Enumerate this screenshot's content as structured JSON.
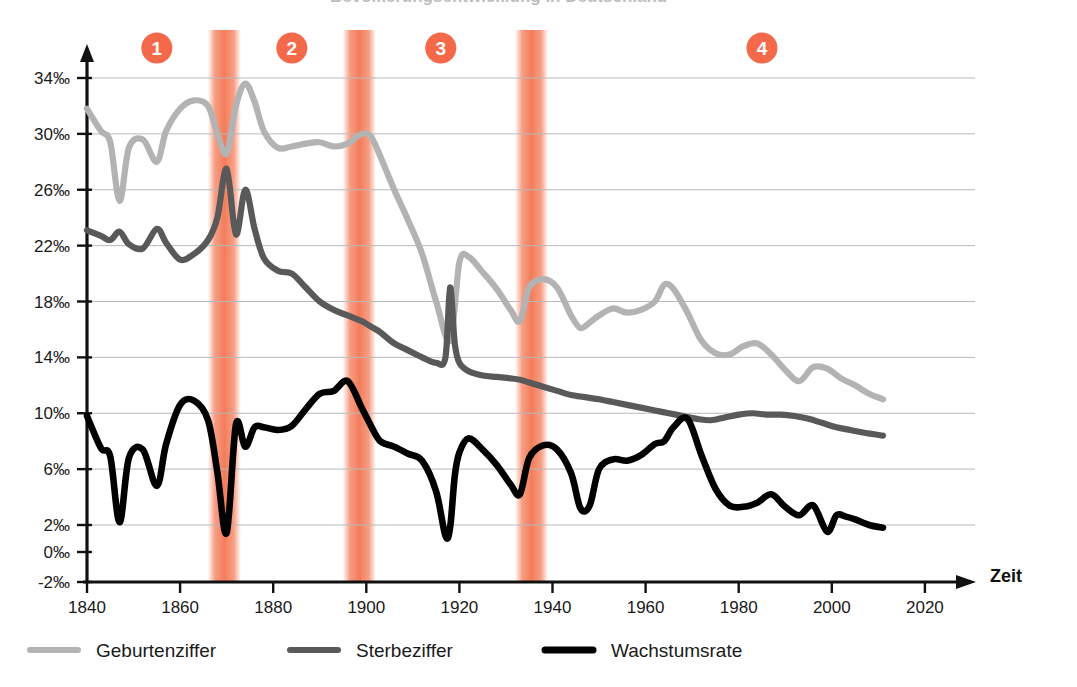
{
  "figure": {
    "title_clipped": "Bevölkerungsentwicklung in Deutschland",
    "x_axis_title": "Zeit",
    "background": "#ffffff",
    "band_color": "#f4815f",
    "marker_color": "#f4694a"
  },
  "legend": {
    "position": "bottom-left",
    "entries": [
      {
        "label": "Geburtenziffer",
        "color": "#b3b3b3"
      },
      {
        "label": "Sterbeziffer",
        "color": "#595959"
      },
      {
        "label": "Wachstumsrate",
        "color": "#000000"
      }
    ]
  },
  "phase_markers": [
    {
      "number": "1",
      "year": 1855
    },
    {
      "number": "2",
      "year": 1884
    },
    {
      "number": "3",
      "year": 1916
    },
    {
      "number": "4",
      "year": 1985
    }
  ],
  "highlight_bands": [
    {
      "from": 1867,
      "to": 1872
    },
    {
      "from": 1896,
      "to": 1901
    },
    {
      "from": 1933,
      "to": 1938
    }
  ],
  "chart_data": {
    "type": "line",
    "title": "Bevölkerungsentwicklung in Deutschland",
    "xlabel": "Zeit",
    "ylabel": "",
    "xlim": [
      1840,
      2028
    ],
    "ylim": [
      -2,
      35
    ],
    "grid": true,
    "x_ticks": [
      1840,
      1860,
      1880,
      1900,
      1920,
      1940,
      1960,
      1980,
      2000,
      2020
    ],
    "y_ticks": [
      -2,
      0,
      2,
      6,
      10,
      14,
      18,
      22,
      26,
      30,
      34
    ],
    "y_tick_labels": [
      "-2‰",
      "0‰",
      "2‰",
      "6‰",
      "10‰",
      "14‰",
      "18‰",
      "22‰",
      "26‰",
      "30‰",
      "34‰"
    ],
    "unit": "‰",
    "series": [
      {
        "name": "Geburtenziffer",
        "color": "#b3b3b3",
        "x": [
          1840,
          1843,
          1845,
          1847,
          1849,
          1852,
          1855,
          1857,
          1860,
          1863,
          1866,
          1868,
          1870,
          1872,
          1874,
          1876,
          1878,
          1881,
          1884,
          1887,
          1890,
          1893,
          1896,
          1899,
          1901,
          1903,
          1906,
          1909,
          1912,
          1915,
          1918,
          1920,
          1922,
          1925,
          1928,
          1931,
          1933,
          1935,
          1938,
          1941,
          1944,
          1946,
          1948,
          1950,
          1953,
          1956,
          1959,
          1962,
          1964,
          1966,
          1969,
          1972,
          1975,
          1978,
          1981,
          1984,
          1987,
          1990,
          1993,
          1996,
          1999,
          2002,
          2005,
          2008,
          2011
        ],
        "y": [
          31.8,
          30.2,
          29.4,
          25.2,
          29.0,
          29.6,
          28.0,
          30.2,
          31.8,
          32.4,
          32.0,
          30.0,
          28.6,
          32.0,
          33.6,
          32.3,
          30.2,
          29.0,
          29.1,
          29.3,
          29.4,
          29.1,
          29.3,
          30.0,
          29.8,
          28.4,
          26.0,
          23.8,
          21.4,
          18.0,
          15.2,
          20.8,
          21.2,
          20.1,
          18.9,
          17.4,
          16.6,
          19.0,
          19.6,
          19.0,
          17.0,
          16.1,
          16.5,
          17.0,
          17.5,
          17.2,
          17.4,
          18.0,
          19.2,
          18.9,
          17.2,
          15.2,
          14.3,
          14.2,
          14.8,
          15.0,
          14.2,
          13.1,
          12.3,
          13.3,
          13.2,
          12.5,
          12.0,
          11.4,
          11.0
        ]
      },
      {
        "name": "Sterbeziffer",
        "color": "#595959",
        "x": [
          1840,
          1843,
          1845,
          1847,
          1849,
          1852,
          1855,
          1857,
          1860,
          1863,
          1866,
          1868,
          1870,
          1872,
          1874,
          1876,
          1878,
          1881,
          1884,
          1887,
          1890,
          1893,
          1896,
          1899,
          1901,
          1903,
          1906,
          1909,
          1912,
          1915,
          1917,
          1918,
          1919,
          1920,
          1922,
          1925,
          1928,
          1931,
          1933,
          1935,
          1938,
          1941,
          1944,
          1946,
          1948,
          1950,
          1953,
          1956,
          1959,
          1962,
          1965,
          1968,
          1971,
          1974,
          1977,
          1980,
          1983,
          1986,
          1989,
          1992,
          1995,
          1998,
          2001,
          2004,
          2007,
          2011
        ],
        "y": [
          23.1,
          22.7,
          22.4,
          23.0,
          22.1,
          21.8,
          23.2,
          22.2,
          21.0,
          21.4,
          22.4,
          24.0,
          27.5,
          22.8,
          26.0,
          23.2,
          21.1,
          20.2,
          20.0,
          19.0,
          18.0,
          17.4,
          17.0,
          16.6,
          16.2,
          15.8,
          15.0,
          14.5,
          14.0,
          13.6,
          14.0,
          19.0,
          15.0,
          13.6,
          13.0,
          12.7,
          12.6,
          12.5,
          12.4,
          12.2,
          11.9,
          11.6,
          11.3,
          11.2,
          11.1,
          11.0,
          10.8,
          10.6,
          10.4,
          10.2,
          10.0,
          9.8,
          9.6,
          9.5,
          9.7,
          9.9,
          10.0,
          9.9,
          9.9,
          9.8,
          9.6,
          9.3,
          9.0,
          8.8,
          8.6,
          8.4
        ]
      },
      {
        "name": "Wachstumsrate",
        "color": "#000000",
        "x": [
          1840,
          1843,
          1845,
          1847,
          1849,
          1852,
          1855,
          1857,
          1860,
          1863,
          1866,
          1868,
          1870,
          1872,
          1874,
          1876,
          1878,
          1881,
          1884,
          1887,
          1890,
          1893,
          1896,
          1899,
          1901,
          1903,
          1906,
          1909,
          1912,
          1915,
          1917,
          1918,
          1919,
          1920,
          1922,
          1925,
          1928,
          1931,
          1933,
          1935,
          1938,
          1941,
          1944,
          1946,
          1948,
          1950,
          1953,
          1956,
          1959,
          1962,
          1964,
          1966,
          1969,
          1972,
          1975,
          1978,
          1981,
          1984,
          1987,
          1990,
          1993,
          1996,
          1999,
          2001,
          2003,
          2005,
          2008,
          2011
        ],
        "y": [
          9.8,
          7.5,
          6.9,
          2.2,
          6.8,
          7.4,
          4.8,
          7.8,
          10.6,
          10.9,
          9.5,
          5.8,
          1.4,
          9.2,
          7.6,
          9.0,
          9.0,
          8.8,
          9.1,
          10.3,
          11.4,
          11.6,
          12.3,
          10.4,
          9.1,
          8.0,
          7.6,
          7.1,
          6.6,
          4.4,
          1.2,
          1.8,
          5.5,
          7.2,
          8.2,
          7.4,
          6.3,
          4.9,
          4.2,
          6.8,
          7.7,
          7.4,
          5.7,
          3.2,
          3.4,
          6.0,
          6.7,
          6.6,
          7.0,
          7.8,
          8.0,
          9.0,
          9.6,
          7.0,
          4.6,
          3.4,
          3.3,
          3.6,
          4.2,
          3.3,
          2.7,
          3.4,
          1.5,
          2.7,
          2.6,
          2.4,
          2.0,
          1.8
        ]
      }
    ]
  }
}
